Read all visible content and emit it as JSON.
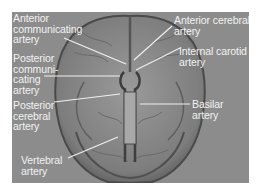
{
  "figure": {
    "background_color": "#8c8c8c",
    "label_color": "#f2f2f2",
    "labels": [
      {
        "id": "anterior-communicating",
        "text": "Anterior\ncommunicating\nartery"
      },
      {
        "id": "posterior-communicating",
        "text": "Posterior\ncommuni-\ncating\nartery"
      },
      {
        "id": "posterior-cerebral",
        "text": "Posterior\ncerebral\nartery"
      },
      {
        "id": "vertebral",
        "text": "Vertebral\nartery"
      },
      {
        "id": "anterior-cerebral",
        "text": "Anterior cerebral\nartery"
      },
      {
        "id": "internal-carotid",
        "text": "Internal carotid\nartery"
      },
      {
        "id": "basilar",
        "text": "Basilar\nartery"
      }
    ]
  }
}
